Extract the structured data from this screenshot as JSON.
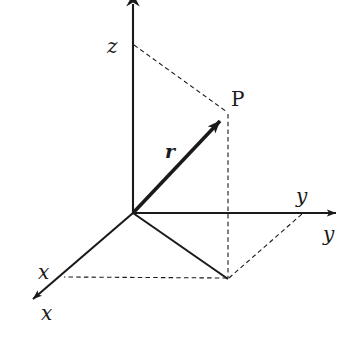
{
  "diagram": {
    "background_color": "#ffffff",
    "stroke_color": "#1a1a1a",
    "labels": {
      "z_axis": "z",
      "y_axis_upper": "y",
      "y_axis_lower": "y",
      "x_axis_upper": "x",
      "x_axis_lower": "x",
      "point_p": "P",
      "vector_r": "r"
    },
    "geometry": {
      "origin": {
        "x": 133,
        "y": 213
      },
      "point_p": {
        "x": 228,
        "y": 113
      },
      "foot_xy": {
        "x": 228,
        "y": 279
      },
      "z_tick": {
        "x": 133,
        "y": 45
      },
      "y_tick": {
        "x": 302,
        "y": 213
      },
      "x_tick": {
        "x": 63,
        "y": 277
      },
      "z_axis_tip": {
        "x": 133,
        "y": 0
      },
      "y_axis_tip": {
        "x": 345,
        "y": 213
      },
      "x_axis_tip": {
        "x": 24,
        "y": 307
      }
    },
    "label_positions": {
      "z_axis": {
        "left": 107,
        "top": 36
      },
      "y_axis_upper": {
        "left": 296,
        "top": 186
      },
      "y_axis_lower": {
        "left": 323,
        "top": 224
      },
      "x_axis_upper": {
        "left": 38,
        "top": 262
      },
      "x_axis_lower": {
        "left": 41,
        "top": 303
      },
      "point_p": {
        "left": 231,
        "top": 89
      },
      "vector_r": {
        "left": 165,
        "top": 142
      }
    },
    "elements": {
      "solid_axes": [
        "z-axis",
        "y-axis",
        "x-axis"
      ],
      "solid_vector": "origin-to-P",
      "solid_projection_lines": [
        "origin-to-foot",
        "foot-to-x-axis-segment"
      ],
      "dashed_lines": [
        "z-tick-to-P",
        "P-to-foot",
        "foot-to-x-tick",
        "foot-to-y-tick"
      ]
    }
  }
}
